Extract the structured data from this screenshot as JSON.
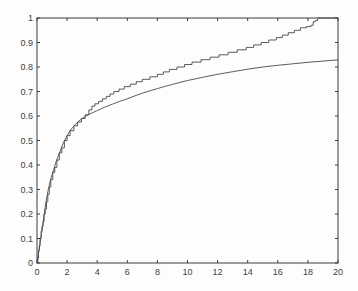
{
  "chart_data": {
    "type": "line",
    "title": "",
    "xlabel": "",
    "ylabel": "",
    "xlim": [
      0,
      20
    ],
    "ylim": [
      0,
      1
    ],
    "grid": false,
    "legend_position": "none",
    "box": true,
    "x_ticks": [
      0,
      2,
      4,
      6,
      8,
      10,
      12,
      14,
      16,
      18,
      20
    ],
    "x_tick_labels": [
      "0",
      "2",
      "4",
      "6",
      "8",
      "10",
      "12",
      "14",
      "16",
      "18",
      "20"
    ],
    "y_ticks": [
      0,
      0.1,
      0.2,
      0.3,
      0.4,
      0.5,
      0.6,
      0.7,
      0.8,
      0.9,
      1
    ],
    "y_tick_labels": [
      "0",
      "0.1",
      "0.2",
      "0.3",
      "0.4",
      "0.5",
      "0.6",
      "0.7",
      "0.8",
      "0.9",
      "1"
    ],
    "axis_color": "#3d3d3d",
    "line_color": "#4a4a4a",
    "plot_background": "#fdfdfd",
    "series": [
      {
        "name": "empirical-cdf-step-curve",
        "style": "step",
        "points": [
          [
            0,
            0
          ],
          [
            0.05,
            0.02
          ],
          [
            0.1,
            0.05
          ],
          [
            0.15,
            0.07
          ],
          [
            0.2,
            0.1
          ],
          [
            0.27,
            0.13
          ],
          [
            0.33,
            0.15
          ],
          [
            0.4,
            0.17
          ],
          [
            0.47,
            0.2
          ],
          [
            0.55,
            0.22
          ],
          [
            0.63,
            0.25
          ],
          [
            0.72,
            0.28
          ],
          [
            0.82,
            0.31
          ],
          [
            0.92,
            0.34
          ],
          [
            1.05,
            0.37
          ],
          [
            1.18,
            0.39
          ],
          [
            1.32,
            0.42
          ],
          [
            1.48,
            0.45
          ],
          [
            1.65,
            0.47
          ],
          [
            1.82,
            0.5
          ],
          [
            2.0,
            0.52
          ],
          [
            2.2,
            0.54
          ],
          [
            2.45,
            0.56
          ],
          [
            2.7,
            0.575
          ],
          [
            2.95,
            0.59
          ],
          [
            3.2,
            0.605
          ],
          [
            3.45,
            0.625
          ],
          [
            3.65,
            0.64
          ],
          [
            3.85,
            0.65
          ],
          [
            4.1,
            0.66
          ],
          [
            4.35,
            0.67
          ],
          [
            4.6,
            0.68
          ],
          [
            4.85,
            0.69
          ],
          [
            5.1,
            0.7
          ],
          [
            5.45,
            0.71
          ],
          [
            5.8,
            0.72
          ],
          [
            6.2,
            0.73
          ],
          [
            6.6,
            0.74
          ],
          [
            7.0,
            0.75
          ],
          [
            7.5,
            0.76
          ],
          [
            8.0,
            0.77
          ],
          [
            8.4,
            0.78
          ],
          [
            8.8,
            0.79
          ],
          [
            9.3,
            0.8
          ],
          [
            9.8,
            0.81
          ],
          [
            10.3,
            0.82
          ],
          [
            10.9,
            0.83
          ],
          [
            11.5,
            0.84
          ],
          [
            12.1,
            0.85
          ],
          [
            12.7,
            0.86
          ],
          [
            13.3,
            0.87
          ],
          [
            13.9,
            0.88
          ],
          [
            14.4,
            0.89
          ],
          [
            14.9,
            0.9
          ],
          [
            15.4,
            0.91
          ],
          [
            15.9,
            0.92
          ],
          [
            16.3,
            0.93
          ],
          [
            16.7,
            0.94
          ],
          [
            17.1,
            0.95
          ],
          [
            17.5,
            0.96
          ],
          [
            17.9,
            0.965
          ],
          [
            18.2,
            0.97
          ],
          [
            18.35,
            0.985
          ],
          [
            18.5,
            0.99
          ],
          [
            18.65,
            1.0
          ],
          [
            20,
            1.0
          ]
        ]
      },
      {
        "name": "fitted-cdf-smooth-curve",
        "style": "smooth",
        "points": [
          [
            0,
            0
          ],
          [
            0.1,
            0.04
          ],
          [
            0.2,
            0.08
          ],
          [
            0.3,
            0.12
          ],
          [
            0.4,
            0.16
          ],
          [
            0.5,
            0.21
          ],
          [
            0.6,
            0.25
          ],
          [
            0.75,
            0.3
          ],
          [
            0.9,
            0.34
          ],
          [
            1.1,
            0.38
          ],
          [
            1.3,
            0.42
          ],
          [
            1.5,
            0.45
          ],
          [
            1.75,
            0.49
          ],
          [
            2.0,
            0.52
          ],
          [
            2.25,
            0.545
          ],
          [
            2.5,
            0.562
          ],
          [
            2.75,
            0.578
          ],
          [
            3.0,
            0.59
          ],
          [
            3.25,
            0.6
          ],
          [
            3.5,
            0.608
          ],
          [
            4.0,
            0.622
          ],
          [
            4.5,
            0.636
          ],
          [
            5.0,
            0.648
          ],
          [
            5.5,
            0.66
          ],
          [
            6.0,
            0.67
          ],
          [
            6.5,
            0.682
          ],
          [
            7.0,
            0.693
          ],
          [
            7.5,
            0.703
          ],
          [
            8.0,
            0.712
          ],
          [
            8.5,
            0.721
          ],
          [
            9.0,
            0.729
          ],
          [
            9.5,
            0.737
          ],
          [
            10.0,
            0.745
          ],
          [
            11.0,
            0.758
          ],
          [
            12.0,
            0.77
          ],
          [
            13.0,
            0.781
          ],
          [
            14.0,
            0.791
          ],
          [
            15.0,
            0.8
          ],
          [
            16.0,
            0.807
          ],
          [
            17.0,
            0.813
          ],
          [
            18.0,
            0.819
          ],
          [
            19.0,
            0.824
          ],
          [
            20.0,
            0.829
          ]
        ]
      }
    ]
  }
}
